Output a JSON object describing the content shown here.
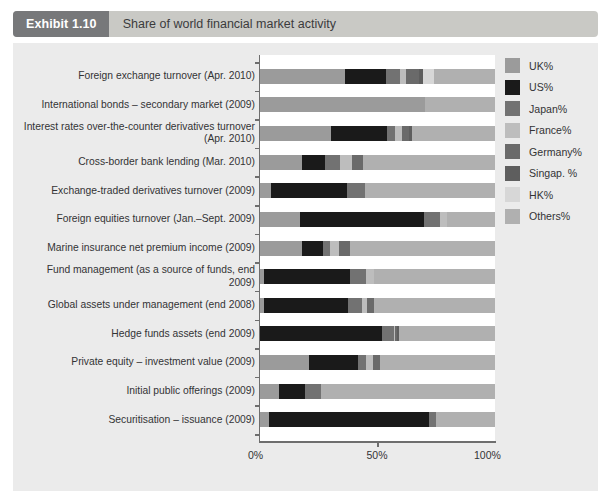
{
  "header": {
    "tag": "Exhibit 1.10",
    "title": "Share of world financial market activity"
  },
  "chart_data": {
    "type": "bar",
    "orientation": "horizontal",
    "stacked": true,
    "normalized_percent": true,
    "title": "Share of world financial market activity",
    "xlabel": "",
    "ylabel": "",
    "xlim": [
      0,
      100
    ],
    "xticks": [
      0,
      50,
      100
    ],
    "xticklabels": [
      "0%",
      "50%",
      "100%"
    ],
    "grid": false,
    "legend_position": "right",
    "categories": [
      "Foreign exchange turnover (Apr. 2010)",
      "International bonds – secondary market (2009)",
      "Interest rates over-the-counter derivatives turnover (Apr. 2010)",
      "Cross-border bank lending (Mar. 2010)",
      "Exchange-traded derivatives turnover (2009)",
      "Foreign equities turnover (Jan.–Sept. 2009)",
      "Marine insurance net premium income (2009)",
      "Fund management (as a source of funds, end 2009)",
      "Global assets under management (end 2008)",
      "Hedge funds assets (end 2009)",
      "Private equity – investment value (2009)",
      "Initial public offerings (2009)",
      "Securitisation – issuance (2009)"
    ],
    "series": [
      {
        "name": "UK%",
        "color": "#9b9b9b",
        "values": [
          36.0,
          70.0,
          30.0,
          18.0,
          4.5,
          17.0,
          18.0,
          1.5,
          1.5,
          0.0,
          21.0,
          8.0,
          4.0
        ]
      },
      {
        "name": "US%",
        "color": "#1a1a1a",
        "values": [
          17.5,
          0.0,
          24.0,
          9.5,
          32.5,
          53.0,
          9.0,
          37.0,
          36.0,
          52.0,
          20.5,
          11.0,
          68.0
        ]
      },
      {
        "name": "Japan%",
        "color": "#727272",
        "values": [
          6.0,
          0.0,
          3.5,
          6.5,
          7.5,
          6.5,
          3.0,
          6.5,
          6.0,
          5.0,
          3.5,
          7.0,
          3.0
        ]
      },
      {
        "name": "France%",
        "color": "#bdbdbd",
        "values": [
          2.5,
          0.0,
          3.0,
          5.0,
          0.0,
          3.0,
          3.5,
          3.5,
          2.0,
          0.5,
          3.0,
          0.0,
          0.0
        ]
      },
      {
        "name": "Germany%",
        "color": "#6a6a6a",
        "values": [
          5.5,
          0.0,
          3.0,
          5.0,
          0.0,
          0.0,
          5.0,
          0.0,
          3.0,
          1.0,
          3.0,
          0.0,
          0.0
        ]
      },
      {
        "name": "Singap.%",
        "color": "#5e5e5e",
        "values": [
          2.0,
          0.0,
          1.0,
          0.0,
          0.0,
          0.0,
          0.0,
          0.0,
          0.0,
          0.5,
          0.0,
          0.0,
          0.0
        ]
      },
      {
        "name": "HK%",
        "color": "#d7d7d7",
        "values": [
          4.5,
          0.0,
          0.0,
          0.0,
          0.0,
          0.0,
          0.0,
          0.0,
          0.0,
          0.0,
          0.0,
          0.0,
          0.0
        ]
      },
      {
        "name": "Others%",
        "color": "#b0b0b0",
        "values": [
          26.0,
          30.0,
          35.5,
          56.0,
          55.5,
          20.5,
          61.5,
          51.5,
          51.5,
          41.0,
          49.0,
          74.0,
          25.0
        ]
      }
    ]
  },
  "legend": {
    "items": [
      {
        "label": "UK%",
        "color": "#9b9b9b"
      },
      {
        "label": "US%",
        "color": "#1a1a1a"
      },
      {
        "label": "Japan%",
        "color": "#727272"
      },
      {
        "label": "France%",
        "color": "#bdbdbd"
      },
      {
        "label": "Germany%",
        "color": "#6a6a6a"
      },
      {
        "label": "Singap. %",
        "color": "#5e5e5e"
      },
      {
        "label": "HK%",
        "color": "#d7d7d7"
      },
      {
        "label": "Others%",
        "color": "#b0b0b0"
      }
    ]
  },
  "colors": {
    "header_tag_bg": "#77787a",
    "header_bar_bg": "#c9c9c5",
    "panel_bg": "#ebebeb",
    "plot_bg": "#ffffff",
    "axis": "#6e6e6e",
    "text": "#333335"
  }
}
